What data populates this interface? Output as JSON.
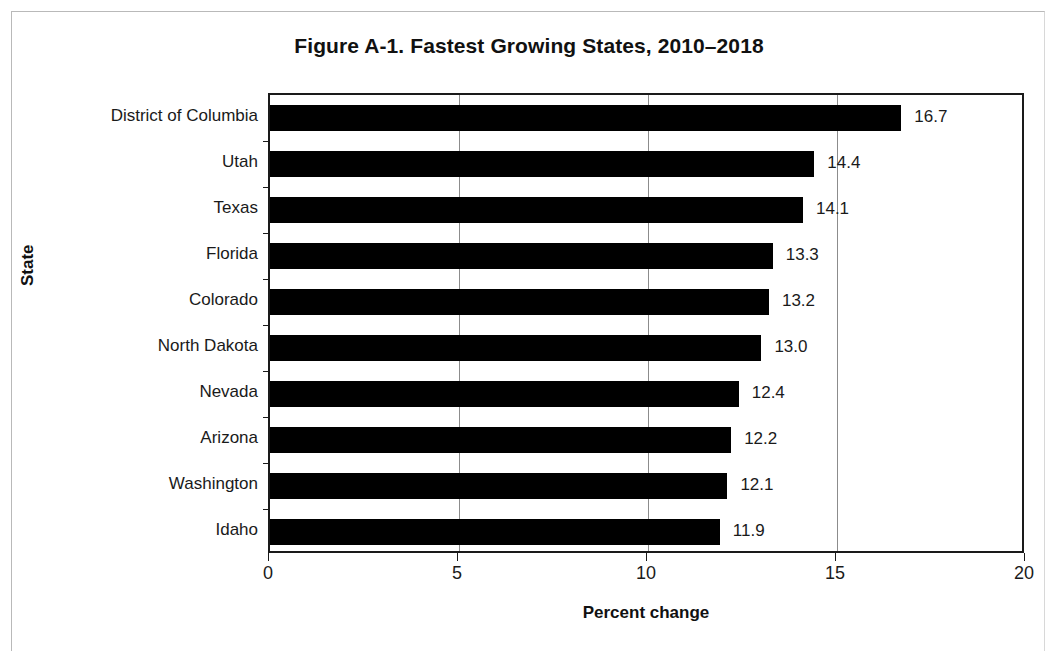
{
  "figure": {
    "title": "Figure A-1. Fastest Growing States, 2010–2018"
  },
  "axes": {
    "x_title": "Percent change",
    "y_title": "State",
    "x_ticks": [
      "0",
      "5",
      "10",
      "15",
      "20"
    ]
  },
  "colors": {
    "bar": "#000000",
    "axis": "#1a1a1a",
    "gridline": "#8c8c8c",
    "background": "#ffffff"
  },
  "chart_data": {
    "type": "bar",
    "orientation": "horizontal",
    "title": "Figure A-1. Fastest Growing States, 2010–2018",
    "xlabel": "Percent change",
    "ylabel": "State",
    "xlim": [
      0,
      20
    ],
    "xticks": [
      0,
      5,
      10,
      15,
      20
    ],
    "grid": "vertical",
    "legend": null,
    "categories": [
      "District of Columbia",
      "Utah",
      "Texas",
      "Florida",
      "Colorado",
      "North Dakota",
      "Nevada",
      "Arizona",
      "Washington",
      "Idaho"
    ],
    "values": [
      16.7,
      14.4,
      14.1,
      13.3,
      13.2,
      13.0,
      12.4,
      12.2,
      12.1,
      11.9
    ],
    "data_labels": [
      "16.7",
      "14.4",
      "14.1",
      "13.3",
      "13.2",
      "13.0",
      "12.4",
      "12.2",
      "12.1",
      "11.9"
    ]
  }
}
